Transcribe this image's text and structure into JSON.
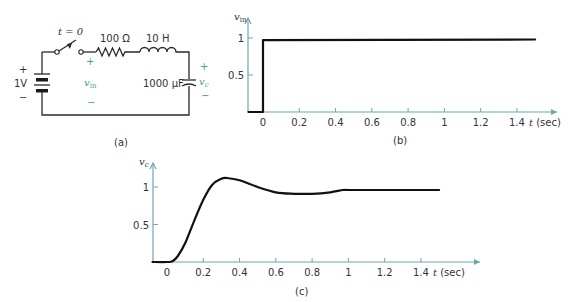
{
  "panels": {
    "a": {
      "caption": "(a)",
      "switch_label": "t = 0",
      "source_label": "1V",
      "source_plus": "+",
      "source_minus": "−",
      "resistor_label": "100 Ω",
      "inductor_label": "10 H",
      "capacitor_label": "1000 μF",
      "vin_label": "v",
      "vin_sub": "in",
      "vin_plus": "+",
      "vin_minus": "−",
      "vc_label": "v",
      "vc_sub": "c",
      "vc_plus": "+",
      "vc_minus": "−"
    },
    "b": {
      "caption": "(b)"
    },
    "c": {
      "caption": "(c)"
    }
  },
  "colors": {
    "axis": "#6aa8b0",
    "curve": "#111111",
    "annotation": "#4b9aa5"
  },
  "chart_data": [
    {
      "id": "b",
      "type": "line",
      "title": "",
      "ylabel": "v_in",
      "xlabel": "t (sec)",
      "x_ticks": [
        "0",
        "0.2",
        "0.4",
        "0.6",
        "0.8",
        "1",
        "1.2",
        "1.4"
      ],
      "y_ticks": [
        "0.5",
        "1"
      ],
      "xlim": [
        -0.08,
        1.6
      ],
      "ylim": [
        0,
        1.3
      ],
      "grid": false,
      "series": [
        {
          "name": "v_in",
          "x": [
            -0.08,
            0,
            0,
            1.5
          ],
          "y": [
            0,
            0,
            0.97,
            0.98
          ]
        }
      ]
    },
    {
      "id": "c",
      "type": "line",
      "title": "",
      "ylabel": "v_c",
      "xlabel": "t (sec)",
      "x_ticks": [
        "0",
        "0.2",
        "0.4",
        "0.6",
        "0.8",
        "1",
        "1.2",
        "1.4"
      ],
      "y_ticks": [
        "0.5",
        "1"
      ],
      "xlim": [
        -0.08,
        1.6
      ],
      "ylim": [
        0,
        1.3
      ],
      "grid": false,
      "series": [
        {
          "name": "v_c",
          "x": [
            -0.08,
            0,
            0.03,
            0.06,
            0.1,
            0.15,
            0.2,
            0.25,
            0.3,
            0.33,
            0.4,
            0.5,
            0.6,
            0.7,
            0.8,
            0.9,
            0.97,
            1.0,
            1.2,
            1.4,
            1.5
          ],
          "y": [
            0,
            0,
            0.01,
            0.08,
            0.25,
            0.55,
            0.83,
            1.03,
            1.11,
            1.12,
            1.09,
            1.0,
            0.93,
            0.91,
            0.91,
            0.93,
            0.96,
            0.96,
            0.96,
            0.96,
            0.96
          ]
        }
      ]
    }
  ]
}
